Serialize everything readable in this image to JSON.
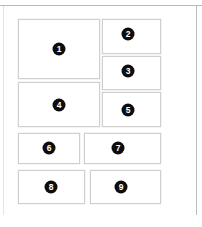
{
  "page": {
    "width": 202,
    "height": 227,
    "background_color": "#ffffff",
    "frame": {
      "top_rule_color": "#b9b9b9",
      "left_rule_color": "#e3e3e3",
      "right_rule_color": "#bdbdbd"
    }
  },
  "panels": [
    {
      "label": "1",
      "x": 18,
      "y": 19,
      "w": 82,
      "h": 60,
      "badge_cx": 59,
      "badge_cy": 49
    },
    {
      "label": "2",
      "x": 102,
      "y": 19,
      "w": 59,
      "h": 35,
      "badge_cx": 128,
      "badge_cy": 34
    },
    {
      "label": "3",
      "x": 102,
      "y": 56,
      "w": 59,
      "h": 34,
      "badge_cx": 128,
      "badge_cy": 71
    },
    {
      "label": "4",
      "x": 18,
      "y": 82,
      "w": 82,
      "h": 45,
      "badge_cx": 59,
      "badge_cy": 105
    },
    {
      "label": "5",
      "x": 102,
      "y": 92,
      "w": 59,
      "h": 35,
      "badge_cx": 128,
      "badge_cy": 110
    },
    {
      "label": "6",
      "x": 18,
      "y": 133,
      "w": 62,
      "h": 31,
      "badge_cx": 49,
      "badge_cy": 148
    },
    {
      "label": "7",
      "x": 84,
      "y": 133,
      "w": 77,
      "h": 31,
      "badge_cx": 118,
      "badge_cy": 148
    },
    {
      "label": "8",
      "x": 18,
      "y": 170,
      "w": 67,
      "h": 34,
      "badge_cx": 51,
      "badge_cy": 187
    },
    {
      "label": "9",
      "x": 90,
      "y": 170,
      "w": 71,
      "h": 34,
      "badge_cx": 121,
      "badge_cy": 187
    }
  ],
  "badge_style": {
    "fill_color": "#0d0d0d",
    "text_color": "#ffffff",
    "diameter": 13
  },
  "panel_style": {
    "border_color": "#cfcfcf",
    "fill_color": "#ffffff"
  }
}
